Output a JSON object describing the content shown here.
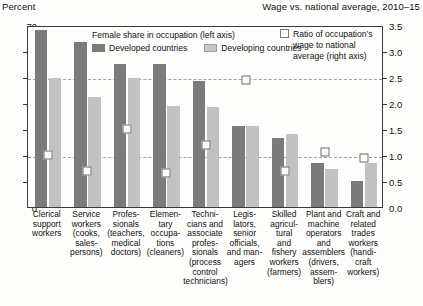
{
  "header": {
    "left_label": "Percent",
    "right_label": "Wage vs. national average, 2010–15"
  },
  "legend": {
    "title": "Female share in occupation (left axis)",
    "developed": "Developed countries",
    "developing": "Developing countries",
    "ratio": "Ratio of occupation’s wage to national average (right axis)",
    "ratio_line1": "Ratio of occupation’s",
    "ratio_line2": "wage to national",
    "ratio_line3": "average (right axis)"
  },
  "colors": {
    "developed": "#7b7b7b",
    "developing": "#c2c2c2",
    "marker_fill": "#fbfbf8",
    "marker_stroke": "#6f6f6f",
    "gridline": "#9aa4ad",
    "axis": "#3a3a3a"
  },
  "chart_data": {
    "type": "bar",
    "xlabel": "",
    "ylabel": "Percent",
    "ylabel_right": "Wage vs. national average, 2010–15",
    "ylim": [
      0,
      70
    ],
    "ylim_right": [
      0.0,
      3.5
    ],
    "yticks": [
      0,
      10,
      20,
      30,
      40,
      50,
      60,
      70
    ],
    "yticks_right": [
      "0.0",
      "0.5",
      "1.0",
      "1.5",
      "2.0",
      "2.5",
      "3.0",
      "3.5"
    ],
    "grid": true,
    "gridlines": [
      20,
      50
    ],
    "legend_position": "top-center",
    "categories": [
      "Clerical support workers",
      "Service workers (cooks, sales-persons)",
      "Professionals (teachers, medical doctors)",
      "Elementary occupations (cleaners)",
      "Technicians and associate professionals (process control technicians)",
      "Legislators, senior officials, and managers",
      "Skilled agricultural and fishery workers (farmers)",
      "Plant and machine operators and assemblers (drivers, assemblers)",
      "Craft and related trades workers (handicraft workers)"
    ],
    "category_lines": [
      [
        "Clerical",
        "support",
        "workers"
      ],
      [
        "Service",
        "workers",
        "(cooks,",
        "sales-",
        "persons)"
      ],
      [
        "Profes-",
        "sionals",
        "(teachers,",
        "medical",
        "doctors)"
      ],
      [
        "Elemen-",
        "tary",
        "occupa-",
        "tions",
        "(cleaners)"
      ],
      [
        "Techni-",
        "cians and",
        "associate",
        "profes-",
        "sionals",
        "(process",
        "control",
        "technicians)"
      ],
      [
        "Legis-",
        "lators,",
        "senior",
        "officials,",
        "and man-",
        "agers"
      ],
      [
        "Skilled",
        "agricul-",
        "tural",
        "and",
        "fishery",
        "workers",
        "(farmers)"
      ],
      [
        "Plant and",
        "machine",
        "operators",
        "and",
        "assemblers",
        "(drivers,",
        "assem-",
        "blers)"
      ],
      [
        "Craft and",
        "related",
        "trades",
        "workers",
        "(handi-",
        "craft",
        "workers)"
      ]
    ],
    "series": [
      {
        "name": "Developed countries",
        "axis": "left",
        "values": [
          68.0,
          63.5,
          55.0,
          55.0,
          48.5,
          31.0,
          26.5,
          17.0,
          10.0
        ]
      },
      {
        "name": "Developing countries",
        "axis": "left",
        "values": [
          49.5,
          42.5,
          49.5,
          39.0,
          38.5,
          31.0,
          28.0,
          14.5,
          17.0
        ]
      },
      {
        "name": "Ratio of occupation's wage to national average",
        "axis": "right",
        "values": [
          1.0,
          0.7,
          1.5,
          0.65,
          1.2,
          2.45,
          0.7,
          1.05,
          0.95
        ]
      }
    ]
  }
}
